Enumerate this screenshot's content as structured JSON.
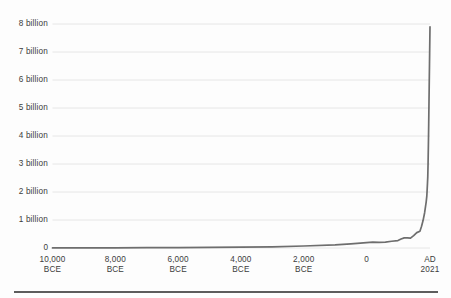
{
  "chart_data": {
    "type": "line",
    "title": "",
    "subtitle": "",
    "xlabel": "",
    "ylabel": "",
    "grid": "horizontal",
    "legend": "none",
    "xlim": [
      -10000,
      2021
    ],
    "ylim": [
      0,
      8000000000
    ],
    "y_ticks": [
      {
        "value": 0,
        "label": "0"
      },
      {
        "value": 1000000000,
        "label": "1 billion"
      },
      {
        "value": 2000000000,
        "label": "2 billion"
      },
      {
        "value": 3000000000,
        "label": "3 billion"
      },
      {
        "value": 4000000000,
        "label": "4 billion"
      },
      {
        "value": 5000000000,
        "label": "5 billion"
      },
      {
        "value": 6000000000,
        "label": "6 billion"
      },
      {
        "value": 7000000000,
        "label": "7 billion"
      },
      {
        "value": 8000000000,
        "label": "8 billion"
      }
    ],
    "x_ticks": [
      {
        "value": -10000,
        "line1": "10,000",
        "line2": "BCE"
      },
      {
        "value": -8000,
        "line1": "8,000",
        "line2": "BCE"
      },
      {
        "value": -6000,
        "line1": "6,000",
        "line2": "BCE"
      },
      {
        "value": -4000,
        "line1": "4,000",
        "line2": "BCE"
      },
      {
        "value": -2000,
        "line1": "2,000",
        "line2": "BCE"
      },
      {
        "value": 0,
        "line1": "0",
        "line2": ""
      },
      {
        "value": 2021,
        "line1": "AD",
        "line2": "2021"
      }
    ],
    "series": [
      {
        "name": "World population",
        "color": "#6e6e6e",
        "x": [
          -10000,
          -9000,
          -8000,
          -7000,
          -6000,
          -5000,
          -4000,
          -3000,
          -2000,
          -1000,
          -500,
          0,
          200,
          400,
          600,
          800,
          1000,
          1100,
          1200,
          1300,
          1400,
          1500,
          1600,
          1700,
          1750,
          1800,
          1850,
          1900,
          1920,
          1940,
          1950,
          1960,
          1970,
          1980,
          1990,
          2000,
          2010,
          2021
        ],
        "values": [
          4000000,
          5000000,
          7000000,
          10000000,
          14000000,
          20000000,
          28000000,
          40000000,
          72000000,
          115000000,
          150000000,
          190000000,
          210000000,
          200000000,
          210000000,
          240000000,
          265000000,
          320000000,
          360000000,
          360000000,
          350000000,
          440000000,
          550000000,
          600000000,
          770000000,
          980000000,
          1260000000,
          1650000000,
          1860000000,
          2300000000,
          2540000000,
          3030000000,
          3700000000,
          4440000000,
          5320000000,
          6140000000,
          6960000000,
          7900000000
        ]
      }
    ],
    "colors": {
      "line": "#6e6e6e",
      "grid": "#e6e6e6",
      "axis": "#6b6b6b",
      "text": "#3c3c3c",
      "background": "#fdfdfd",
      "footer_rule": "#5d5d5d"
    }
  }
}
